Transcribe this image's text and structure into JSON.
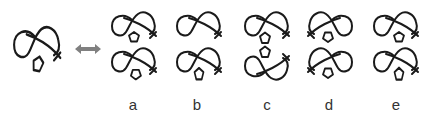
{
  "figure": {
    "type": "knot-pentagon puzzle",
    "stroke_color": "#1a1a1a",
    "arrow_color": "#808080",
    "reference": {
      "name": "reference-figure",
      "pentagon": "below-left, rotated"
    },
    "arrow": {
      "icon": "double-headed-arrow"
    },
    "options": [
      {
        "label": "a",
        "top": "pentagon-small",
        "bottom": "pentagon-rotated"
      },
      {
        "label": "b",
        "top": "pentagon-no",
        "bottom": "pentagon-vertical"
      },
      {
        "label": "c",
        "top": "pentagon-below",
        "bottom": "pentagon-above-mirrored"
      },
      {
        "label": "d",
        "top": "pentagon-left-flipped",
        "bottom": "pentagon-left-flipped"
      },
      {
        "label": "e",
        "top": "pentagon-right",
        "bottom": "pentagon-right-vertical"
      }
    ]
  }
}
